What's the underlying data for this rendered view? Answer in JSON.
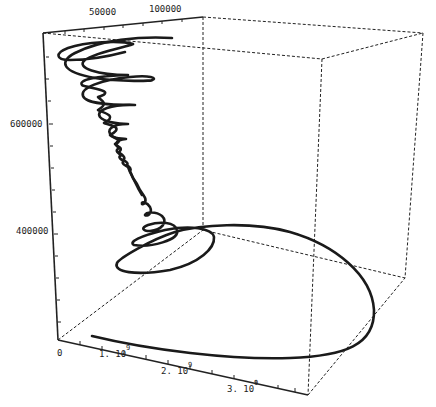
{
  "chart_data": {
    "type": "line3d",
    "title": "",
    "axes": {
      "x": {
        "label": "",
        "ticks": [
          {
            "label": "0",
            "exp": ""
          },
          {
            "label": "1. 10",
            "exp": "9"
          },
          {
            "label": "2. 10",
            "exp": "9"
          },
          {
            "label": "3. 10",
            "exp": "9"
          }
        ],
        "range": [
          0,
          3400000000.0
        ]
      },
      "y": {
        "label": "",
        "ticks": [
          {
            "label": "50000"
          },
          {
            "label": "100000"
          }
        ],
        "range": [
          0,
          120000
        ]
      },
      "z": {
        "label": "",
        "ticks": [
          {
            "label": "400000"
          },
          {
            "label": "600000"
          }
        ],
        "range": [
          250000,
          780000
        ]
      }
    },
    "box": true,
    "grid": false,
    "legend": null,
    "series": [
      {
        "name": "trajectory",
        "description": "3D parametric spiral: starts near x=0,z~250000 sweeping out to large x, loops back, then winds upward in damped oscillations that grow in amplitude toward top (z~750000)",
        "color": "#1a1a1a"
      }
    ]
  }
}
